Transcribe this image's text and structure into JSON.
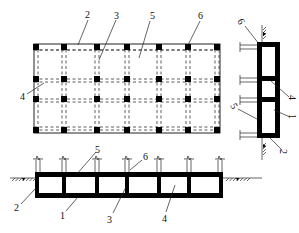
{
  "diagram": {
    "views": [
      {
        "id": "plan",
        "name": "plan view"
      },
      {
        "id": "section-long",
        "name": "longitudinal section"
      },
      {
        "id": "section-cross",
        "name": "cross section"
      }
    ],
    "plan": {
      "column_count_x": 7,
      "column_count_y": 4,
      "labels": {
        "l2": "2",
        "l3": "3",
        "l5": "5",
        "l6": "6",
        "l4": "4"
      }
    },
    "section_long": {
      "cell_count": 6,
      "labels": {
        "l5": "5",
        "l6": "6",
        "l2": "2",
        "l1": "1",
        "l3": "3",
        "l4": "4"
      }
    },
    "section_cross": {
      "cell_count": 3,
      "labels": {
        "l6": "6",
        "l4": "4",
        "l5": "5",
        "l1": "1",
        "l2": "2"
      }
    },
    "legend": [
      {
        "number": "1",
        "meaning": "bottom slab"
      },
      {
        "number": "2",
        "meaning": "outer wall"
      },
      {
        "number": "3",
        "meaning": "inner wall"
      },
      {
        "number": "4",
        "meaning": "compartment"
      },
      {
        "number": "5",
        "meaning": "top slab"
      },
      {
        "number": "6",
        "meaning": "column"
      }
    ]
  }
}
